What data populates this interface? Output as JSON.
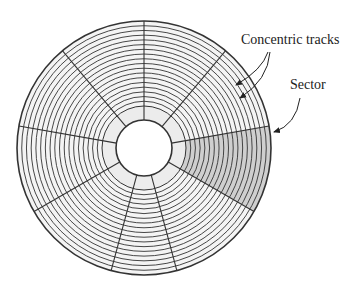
{
  "diagram": {
    "labels": {
      "tracks": "Concentric tracks",
      "sector": "Sector"
    },
    "disk": {
      "cx": 144,
      "cy": 148,
      "outer_radius": 127,
      "hub_radius": 28,
      "inner_band_radius": 42,
      "track_count": 17,
      "sector_angles_deg": [
        -90,
        -50,
        -10,
        30,
        75,
        105,
        150,
        190,
        230
      ],
      "highlighted_sector": {
        "start_deg": -10,
        "end_deg": 30
      }
    },
    "colors": {
      "line": "#333333",
      "disk_fill": "#f4f4f4",
      "band_fill": "#ececec",
      "sector_fill": "#cfcfcf"
    }
  }
}
